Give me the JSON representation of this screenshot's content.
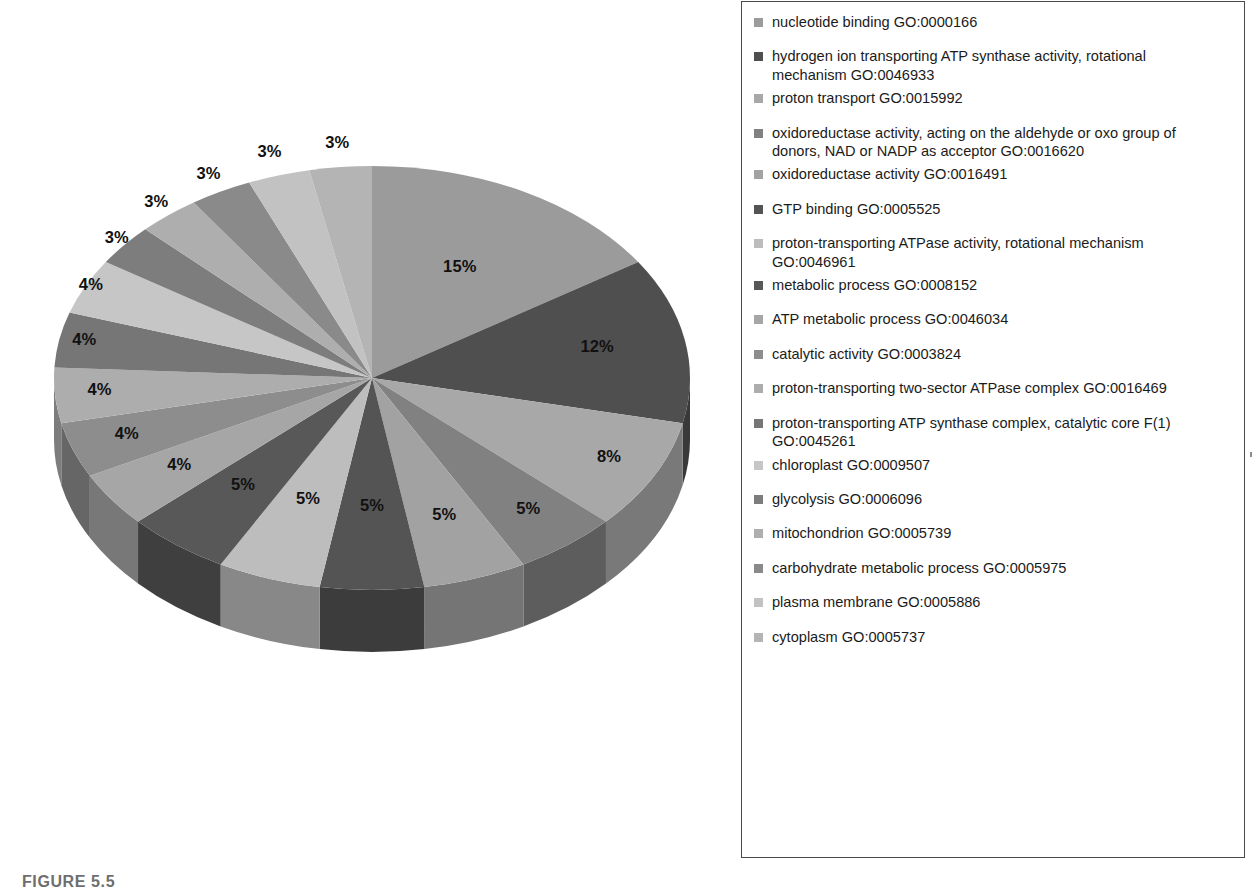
{
  "figure": {
    "caption": "FIGURE 5.5"
  },
  "legend": {
    "items": [
      {
        "label": "nucleotide binding GO:0000166",
        "color": "#9b9b9b",
        "tight": false
      },
      {
        "label": "hydrogen ion transporting ATP synthase activity, rotational mechanism GO:0046933",
        "color": "#4f4f4f",
        "tight": true
      },
      {
        "label": "proton transport GO:0015992",
        "color": "#a8a8a8",
        "tight": false
      },
      {
        "label": "oxidoreductase activity, acting on the aldehyde or oxo group of donors, NAD or NADP as acceptor GO:0016620",
        "color": "#818181",
        "tight": true
      },
      {
        "label": "oxidoreductase activity GO:0016491",
        "color": "#a2a2a2",
        "tight": false
      },
      {
        "label": "GTP binding GO:0005525",
        "color": "#545454",
        "tight": false
      },
      {
        "label": "proton-transporting ATPase activity, rotational mechanism GO:0046961",
        "color": "#bdbdbd",
        "tight": true
      },
      {
        "label": "metabolic process GO:0008152",
        "color": "#585858",
        "tight": false
      },
      {
        "label": "ATP metabolic process GO:0046034",
        "color": "#a6a6a6",
        "tight": false
      },
      {
        "label": "catalytic activity GO:0003824",
        "color": "#8d8d8d",
        "tight": false
      },
      {
        "label": "proton-transporting two-sector ATPase complex GO:0016469",
        "color": "#adadad",
        "tight": false
      },
      {
        "label": "proton-transporting ATP synthase complex, catalytic core F(1) GO:0045261",
        "color": "#767676",
        "tight": true
      },
      {
        "label": "chloroplast GO:0009507",
        "color": "#c6c6c6",
        "tight": false
      },
      {
        "label": "glycolysis GO:0006096",
        "color": "#7d7d7d",
        "tight": false
      },
      {
        "label": "mitochondrion GO:0005739",
        "color": "#aeaeae",
        "tight": false
      },
      {
        "label": "carbohydrate metabolic process GO:0005975",
        "color": "#8a8a8a",
        "tight": false
      },
      {
        "label": "plasma membrane GO:0005886",
        "color": "#c2c2c2",
        "tight": false
      },
      {
        "label": "cytoplasm GO:0005737",
        "color": "#b4b4b4",
        "tight": false
      }
    ]
  },
  "chart_data": {
    "type": "pie",
    "title": "",
    "style": "3d-exploded-depth",
    "legend_position": "right",
    "value_suffix": "%",
    "start_angle_deg": 0,
    "direction": "clockwise",
    "categories": [
      "nucleotide binding GO:0000166",
      "hydrogen ion transporting ATP synthase activity, rotational mechanism GO:0046933",
      "proton transport GO:0015992",
      "oxidoreductase activity, acting on the aldehyde or oxo group of donors, NAD or NADP as acceptor GO:0016620",
      "oxidoreductase activity GO:0016491",
      "GTP binding GO:0005525",
      "proton-transporting ATPase activity, rotational mechanism GO:0046961",
      "metabolic process GO:0008152",
      "ATP metabolic process GO:0046034",
      "catalytic activity GO:0003824",
      "proton-transporting two-sector ATPase complex GO:0016469",
      "proton-transporting ATP synthase complex, catalytic core F(1) GO:0045261",
      "chloroplast GO:0009507",
      "glycolysis GO:0006096",
      "mitochondrion GO:0005739",
      "carbohydrate metabolic process GO:0005975",
      "plasma membrane GO:0005886",
      "cytoplasm GO:0005737"
    ],
    "values": [
      15,
      12,
      8,
      5,
      5,
      5,
      5,
      5,
      4,
      4,
      4,
      4,
      4,
      3,
      3,
      3,
      3,
      3
    ],
    "labels": [
      "15%",
      "12%",
      "8%",
      "5%",
      "5%",
      "5%",
      "5%",
      "5%",
      "4%",
      "4%",
      "4%",
      "4%",
      "4%",
      "3%",
      "3%",
      "3%",
      "3%",
      "3%"
    ],
    "colors": [
      "#9b9b9b",
      "#4f4f4f",
      "#a8a8a8",
      "#818181",
      "#a2a2a2",
      "#545454",
      "#bdbdbd",
      "#585858",
      "#a6a6a6",
      "#8d8d8d",
      "#adadad",
      "#767676",
      "#c6c6c6",
      "#7d7d7d",
      "#aeaeae",
      "#8a8a8a",
      "#c2c2c2",
      "#b4b4b4"
    ],
    "geometry": {
      "center_x": 372,
      "center_y": 378,
      "radius_x": 318,
      "radius_y": 212,
      "depth": 62
    }
  }
}
